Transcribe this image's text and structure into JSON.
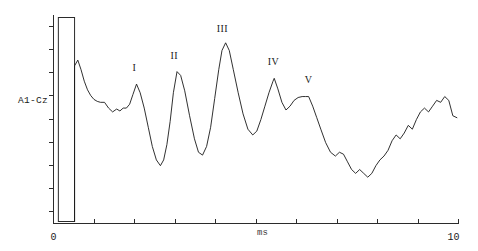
{
  "chart_data": {
    "type": "line",
    "title": "",
    "subtitle": "",
    "xlabel": "ms",
    "ylabel": "A1-Cz",
    "xlim": [
      0,
      10
    ],
    "ylim": [
      -1.0,
      1.0
    ],
    "grid": false,
    "legend": false,
    "channel_label": "A1-Cz",
    "x_tick_labels": [
      "0",
      "10"
    ],
    "x_tick_values": [
      0,
      1,
      2,
      3,
      4,
      5,
      6,
      7,
      8,
      9,
      10
    ],
    "x_first_label": "0",
    "x_last_label": "10",
    "unit_label": "ms",
    "y_tick_count": 9,
    "stimulus_artifact": {
      "x_start": 0.12,
      "x_end": 0.52,
      "top": 1.0,
      "bottom": -0.92
    },
    "annotations": [
      {
        "label": "I",
        "x": 2.05,
        "y": 0.37
      },
      {
        "label": "II",
        "x": 3.05,
        "y": 0.5
      },
      {
        "label": "III",
        "x": 4.25,
        "y": 0.78
      },
      {
        "label": "IV",
        "x": 5.45,
        "y": 0.44
      },
      {
        "label": "V",
        "x": 6.3,
        "y": 0.25
      }
    ],
    "peaks": [
      {
        "name": "I",
        "latency_ms": 2.05,
        "amplitude": 0.27
      },
      {
        "name": "II",
        "latency_ms": 3.05,
        "amplitude": 0.4
      },
      {
        "name": "III",
        "latency_ms": 4.25,
        "amplitude": 0.7
      },
      {
        "name": "IV",
        "latency_ms": 5.45,
        "amplitude": 0.33
      },
      {
        "name": "V",
        "latency_ms": 6.3,
        "amplitude": 0.14
      }
    ],
    "series": [
      {
        "name": "A1-Cz",
        "x": [
          0.52,
          0.6,
          0.68,
          0.76,
          0.84,
          0.92,
          1.0,
          1.08,
          1.16,
          1.26,
          1.36,
          1.46,
          1.56,
          1.64,
          1.72,
          1.8,
          1.88,
          1.96,
          2.05,
          2.14,
          2.24,
          2.34,
          2.44,
          2.54,
          2.64,
          2.72,
          2.8,
          2.88,
          2.96,
          3.05,
          3.14,
          3.24,
          3.36,
          3.48,
          3.58,
          3.68,
          3.78,
          3.88,
          3.98,
          4.08,
          4.16,
          4.25,
          4.34,
          4.44,
          4.56,
          4.68,
          4.8,
          4.92,
          5.02,
          5.12,
          5.22,
          5.32,
          5.42,
          5.45,
          5.54,
          5.64,
          5.74,
          5.84,
          5.94,
          6.04,
          6.14,
          6.22,
          6.3,
          6.4,
          6.5,
          6.6,
          6.72,
          6.84,
          6.96,
          7.06,
          7.16,
          7.26,
          7.36,
          7.46,
          7.56,
          7.66,
          7.76,
          7.86,
          7.96,
          8.06,
          8.16,
          8.26,
          8.36,
          8.46,
          8.56,
          8.66,
          8.76,
          8.86,
          8.96,
          9.06,
          9.16,
          9.26,
          9.36,
          9.46,
          9.56,
          9.66,
          9.76,
          9.86,
          9.96
        ],
        "y": [
          0.46,
          0.52,
          0.42,
          0.3,
          0.21,
          0.15,
          0.11,
          0.09,
          0.08,
          0.08,
          0.02,
          -0.02,
          0.01,
          -0.01,
          0.02,
          0.02,
          0.06,
          0.16,
          0.27,
          0.18,
          0.02,
          -0.18,
          -0.38,
          -0.52,
          -0.58,
          -0.52,
          -0.36,
          -0.12,
          0.18,
          0.4,
          0.36,
          0.2,
          -0.06,
          -0.3,
          -0.44,
          -0.47,
          -0.38,
          -0.18,
          0.12,
          0.42,
          0.62,
          0.7,
          0.62,
          0.42,
          0.18,
          -0.04,
          -0.2,
          -0.26,
          -0.22,
          -0.1,
          0.04,
          0.18,
          0.3,
          0.33,
          0.22,
          0.08,
          0.0,
          0.04,
          0.1,
          0.13,
          0.14,
          0.14,
          0.14,
          0.04,
          -0.08,
          -0.2,
          -0.34,
          -0.44,
          -0.48,
          -0.44,
          -0.46,
          -0.54,
          -0.62,
          -0.66,
          -0.62,
          -0.66,
          -0.7,
          -0.66,
          -0.58,
          -0.52,
          -0.48,
          -0.42,
          -0.32,
          -0.26,
          -0.3,
          -0.24,
          -0.16,
          -0.2,
          -0.1,
          -0.02,
          0.02,
          -0.02,
          0.04,
          0.1,
          0.08,
          0.14,
          0.1,
          -0.06,
          -0.08
        ]
      }
    ]
  }
}
